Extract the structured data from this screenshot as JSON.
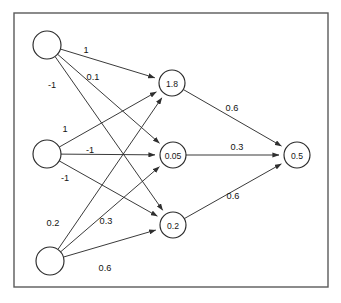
{
  "diagram": {
    "frame": {
      "x": 14,
      "y": 13,
      "width": 314,
      "height": 274
    },
    "colors": {
      "background": "#ffffff",
      "frame_stroke": "#5a5a5a",
      "node_stroke": "#2a2a2a",
      "edge_stroke": "#2f2f2f",
      "text": "#131313"
    },
    "layers": [
      {
        "name": "input-layer",
        "nodes": [
          {
            "id": "i1",
            "label": "",
            "cx": 47,
            "cy": 45,
            "r": 14
          },
          {
            "id": "i2",
            "label": "",
            "cx": 47,
            "cy": 154,
            "r": 14
          },
          {
            "id": "i3",
            "label": "",
            "cx": 50,
            "cy": 261,
            "r": 14
          }
        ]
      },
      {
        "name": "hidden-layer",
        "nodes": [
          {
            "id": "h1",
            "label": "1.8",
            "cx": 172,
            "cy": 83,
            "r": 13
          },
          {
            "id": "h2",
            "label": "0.05",
            "cx": 173,
            "cy": 155,
            "r": 13
          },
          {
            "id": "h3",
            "label": "0.2",
            "cx": 173,
            "cy": 225,
            "r": 13
          }
        ]
      },
      {
        "name": "output-layer",
        "nodes": [
          {
            "id": "o1",
            "label": "0.5",
            "cx": 297,
            "cy": 155,
            "r": 13
          }
        ]
      }
    ],
    "edges": [
      {
        "id": "e-i1-h1",
        "from": "i1",
        "to": "h1",
        "weight": "1",
        "label_x": 86,
        "label_y": 50
      },
      {
        "id": "e-i1-h2",
        "from": "i1",
        "to": "h2",
        "weight": "0.1",
        "label_x": 93,
        "label_y": 77
      },
      {
        "id": "e-i1-h3",
        "from": "i1",
        "to": "h3",
        "weight": "-1",
        "label_x": 52,
        "label_y": 85
      },
      {
        "id": "e-i2-h1",
        "from": "i2",
        "to": "h1",
        "weight": "1",
        "label_x": 65,
        "label_y": 129
      },
      {
        "id": "e-i2-h2",
        "from": "i2",
        "to": "h2",
        "weight": "-1",
        "label_x": 90,
        "label_y": 150
      },
      {
        "id": "e-i2-h3",
        "from": "i2",
        "to": "h3",
        "weight": "-1",
        "label_x": 65,
        "label_y": 178
      },
      {
        "id": "e-i3-h1",
        "from": "i3",
        "to": "h1",
        "weight": "0.2",
        "label_x": 53,
        "label_y": 223
      },
      {
        "id": "e-i3-h2",
        "from": "i3",
        "to": "h2",
        "weight": "0.3",
        "label_x": 106,
        "label_y": 221
      },
      {
        "id": "e-i3-h3",
        "from": "i3",
        "to": "h3",
        "weight": "0.6",
        "label_x": 105,
        "label_y": 268
      },
      {
        "id": "e-h1-o1",
        "from": "h1",
        "to": "o1",
        "weight": "0.6",
        "label_x": 232,
        "label_y": 108
      },
      {
        "id": "e-h2-o1",
        "from": "h2",
        "to": "o1",
        "weight": "0.3",
        "label_x": 237,
        "label_y": 147
      },
      {
        "id": "e-h3-o1",
        "from": "h3",
        "to": "o1",
        "weight": "0.6",
        "label_x": 233,
        "label_y": 196
      }
    ]
  },
  "chart_data": {
    "type": "diagram",
    "node_values": {
      "input": [
        "",
        "",
        ""
      ],
      "hidden": [
        "1.8",
        "0.05",
        "0.2"
      ],
      "output": [
        "0.5"
      ]
    },
    "weights": {
      "input_to_hidden": [
        {
          "from": "input-1",
          "to": [
            "hidden-1",
            "hidden-2",
            "hidden-3"
          ],
          "values": [
            "1",
            "0.1",
            "-1"
          ]
        },
        {
          "from": "input-2",
          "to": [
            "hidden-1",
            "hidden-2",
            "hidden-3"
          ],
          "values": [
            "1",
            "-1",
            "-1"
          ]
        },
        {
          "from": "input-3",
          "to": [
            "hidden-1",
            "hidden-2",
            "hidden-3"
          ],
          "values": [
            "0.2",
            "0.3",
            "0.6"
          ]
        }
      ],
      "hidden_to_output": [
        {
          "from": "hidden-1",
          "to": "output-1",
          "value": "0.6"
        },
        {
          "from": "hidden-2",
          "to": "output-1",
          "value": "0.3"
        },
        {
          "from": "hidden-3",
          "to": "output-1",
          "value": "0.6"
        }
      ]
    }
  }
}
